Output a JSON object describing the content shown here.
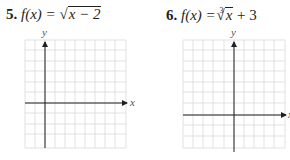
{
  "problems": [
    {
      "number": "5.",
      "lhs": "f(x) =",
      "radical": "√",
      "radicand": "x − 2",
      "index": "",
      "tail": "",
      "equation_text": "f(x) = √(x − 2)",
      "axes": {
        "x_label": "x",
        "y_label": "y"
      },
      "grid": {
        "columns": 10,
        "rows": 11
      }
    },
    {
      "number": "6.",
      "lhs": "f(x) =",
      "radical": "√",
      "radicand": "x",
      "index": "3",
      "tail": "+ 3",
      "equation_text": "f(x) = ∛x + 3",
      "axes": {
        "x_label": "x",
        "y_label": "y"
      },
      "grid": {
        "columns": 10,
        "rows": 11
      }
    }
  ]
}
